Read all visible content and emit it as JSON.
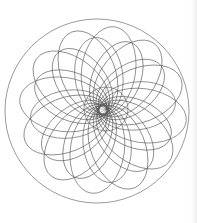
{
  "drawing": {
    "type": "spirograph",
    "stroke_color": "#555555",
    "background": "#ffffff",
    "outer_circle": {
      "cx": 97,
      "cy": 111,
      "r": 92
    },
    "inner_circle": {
      "cx": 106,
      "cy": 109,
      "r": 22
    },
    "petals": {
      "count": 12,
      "cx": 103,
      "cy": 110,
      "offset": 40,
      "rx": 44,
      "ry": 27,
      "layers": 2
    }
  }
}
